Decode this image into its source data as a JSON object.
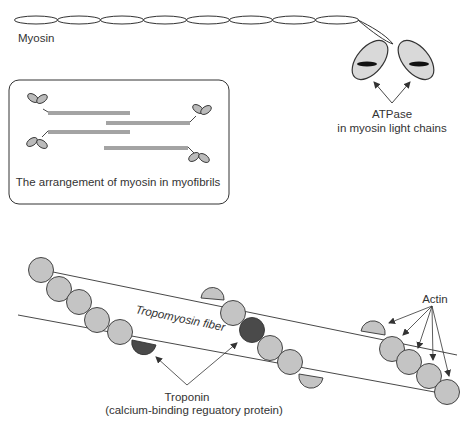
{
  "labels": {
    "myosin": "Myosin",
    "atpase_line1": "ATPase",
    "atpase_line2": "in myosin light chains",
    "arrangement_caption": "The arrangement of myosin in myofibrils",
    "tropomyosin": "Tropomyosin fiber",
    "actin": "Actin",
    "troponin_line1": "Troponin",
    "troponin_line2": "(calcium-binding reguatory protein)"
  },
  "colors": {
    "stroke": "#333333",
    "head_fill": "#d9d9d9",
    "actin_fill": "#c4c4c4",
    "troponin_fill": "#4a4a4a",
    "atpase_mark": "#111111"
  }
}
